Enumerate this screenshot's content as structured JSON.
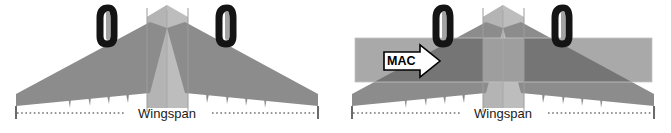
{
  "figure": {
    "background_color": "#ffffff",
    "panels": [
      {
        "id": "left",
        "name": "wingspan-only-view",
        "dimension_label": "Wingspan",
        "has_mac_band": false,
        "mac_label": "",
        "engine_count": 2
      },
      {
        "id": "right",
        "name": "wingspan-with-mac-view",
        "dimension_label": "Wingspan",
        "has_mac_band": true,
        "mac_label": "MAC",
        "engine_count": 2
      }
    ]
  },
  "colors": {
    "wing_gray": "#8e8e8e",
    "wing_gray_shaded": "#7a7a7a",
    "fuselage_light": "#b9b9b9",
    "fuselage_mid": "#a8a8a8",
    "nacelle_black": "#161616",
    "nacelle_inner": "#9a9a9a",
    "mac_band": "#a9a9a9",
    "mac_band_overlap": "#6f6f6f",
    "dimension_line": "#2b2b2b",
    "label_text": "#1a1a1a",
    "arrow_fill": "#ffffff",
    "arrow_stroke": "#000000",
    "background": "#ffffff"
  },
  "geometry": {
    "panel_width": 335,
    "panel_height": 133,
    "wing_tip_left_x": 16,
    "wing_tip_right_x": 318,
    "wingspan_line_y": 112,
    "mac_band_top_y": 38,
    "mac_band_bottom_y": 82,
    "engine_left_x": 103,
    "engine_right_x": 172,
    "centerline_x": 167
  }
}
